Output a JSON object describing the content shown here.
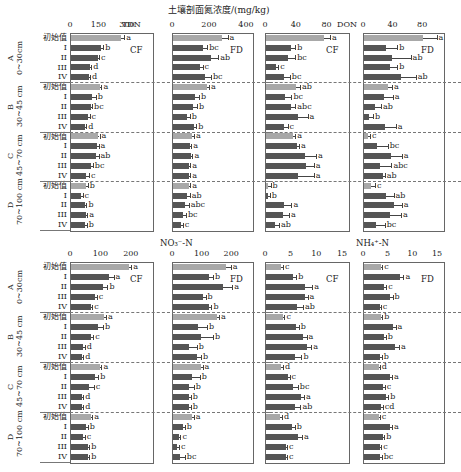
{
  "figure": {
    "top_title": "土壤剖面氮浓度/(mg/kg)",
    "bottom_left_title": "NO₃⁻-N",
    "bottom_right_title": "NH₄⁺-N",
    "row_labels": [
      "初始值",
      "I",
      "II",
      "III",
      "IV"
    ],
    "groups": [
      {
        "letter": "A",
        "depth": "0~30cm"
      },
      {
        "letter": "B",
        "depth": "30~45 cm"
      },
      {
        "letter": "C",
        "depth": "45~70 cm"
      },
      {
        "letter": "D",
        "depth": "70~100 cm"
      }
    ],
    "colors": {
      "initial_bar": "#a8a8a8",
      "treatment_bar": "#555555"
    }
  },
  "chart_data": [
    {
      "type": "bar",
      "orientation": "horizontal",
      "title": "TDN",
      "site": "CF",
      "xlabel": "TDN",
      "xlim": [
        0,
        400
      ],
      "xticks": [
        0,
        150,
        300
      ],
      "categories": [
        "A-初始值",
        "A-I",
        "A-II",
        "A-III",
        "A-IV",
        "B-初始值",
        "B-I",
        "B-II",
        "B-III",
        "B-IV",
        "C-初始值",
        "C-I",
        "C-II",
        "C-III",
        "C-IV",
        "D-初始值",
        "D-I",
        "D-II",
        "D-III",
        "D-IV"
      ],
      "values": [
        265,
        160,
        140,
        100,
        95,
        150,
        110,
        105,
        90,
        75,
        140,
        135,
        130,
        105,
        80,
        80,
        55,
        75,
        80,
        75
      ],
      "errors": [
        15,
        10,
        8,
        6,
        5,
        10,
        20,
        6,
        8,
        5,
        10,
        10,
        15,
        10,
        15,
        8,
        6,
        6,
        6,
        8
      ],
      "letters": [
        "a",
        "b",
        "c",
        "d",
        "d",
        "a",
        "b",
        "bc",
        "c",
        "d",
        "a",
        "a",
        "ab",
        "bc",
        "c",
        "b",
        "c",
        "b",
        "a",
        "b"
      ]
    },
    {
      "type": "bar",
      "orientation": "horizontal",
      "title": "TDN",
      "site": "FD",
      "xlim": [
        0,
        400
      ],
      "xticks": [
        0,
        200,
        400
      ],
      "categories": [
        "A-初始值",
        "A-I",
        "A-II",
        "A-III",
        "A-IV",
        "B-初始值",
        "B-I",
        "B-II",
        "B-III",
        "B-IV",
        "C-初始值",
        "C-I",
        "C-II",
        "C-III",
        "C-IV",
        "D-初始值",
        "D-I",
        "D-II",
        "D-III",
        "D-IV"
      ],
      "values": [
        265,
        160,
        205,
        145,
        175,
        185,
        120,
        110,
        75,
        115,
        105,
        90,
        95,
        85,
        85,
        85,
        75,
        65,
        55,
        45
      ],
      "errors": [
        30,
        25,
        40,
        15,
        30,
        10,
        20,
        20,
        15,
        10,
        8,
        8,
        10,
        8,
        8,
        8,
        15,
        20,
        15,
        8
      ],
      "letters": [
        "a",
        "bc",
        "ab",
        "c",
        "bc",
        "a",
        "b",
        "b",
        "b",
        "b",
        "a",
        "a",
        "a",
        "a",
        "a",
        "a",
        "ab",
        "abc",
        "bc",
        "c"
      ]
    },
    {
      "type": "bar",
      "orientation": "horizontal",
      "title": "DON",
      "site": "CF",
      "xlabel": "DON",
      "xlim": [
        0,
        100
      ],
      "xticks": [
        0,
        40,
        80
      ],
      "categories": [
        "A-初始值",
        "A-I",
        "A-II",
        "A-III",
        "A-IV",
        "B-初始值",
        "B-I",
        "B-II",
        "B-III",
        "B-IV",
        "C-初始值",
        "C-I",
        "C-II",
        "C-III",
        "C-IV",
        "D-初始值",
        "D-I",
        "D-II",
        "D-III",
        "D-IV"
      ],
      "values": [
        75,
        33,
        28,
        13,
        23,
        39,
        25,
        33,
        42,
        23,
        35,
        40,
        50,
        52,
        42,
        3,
        2,
        23,
        22,
        12
      ],
      "errors": [
        8,
        5,
        10,
        3,
        8,
        5,
        8,
        5,
        12,
        5,
        3,
        3,
        15,
        10,
        20,
        3,
        3,
        10,
        8,
        5
      ],
      "letters": [
        "a",
        "b",
        "bc",
        "c",
        "bc",
        "ab",
        "bc",
        "abc",
        "a",
        "c",
        "a",
        "a",
        "a",
        "a",
        "a",
        "b",
        "b",
        "a",
        "a",
        "ab"
      ]
    },
    {
      "type": "bar",
      "orientation": "horizontal",
      "title": "DON",
      "site": "FD",
      "xlim": [
        0,
        100
      ],
      "xticks": [
        0,
        40,
        80
      ],
      "categories": [
        "A-初始值",
        "A-I",
        "A-II",
        "A-III",
        "A-IV",
        "B-初始值",
        "B-I",
        "B-II",
        "B-III",
        "B-IV",
        "C-初始值",
        "C-I",
        "C-II",
        "C-III",
        "C-IV",
        "D-初始值",
        "D-I",
        "D-II",
        "D-III",
        "D-IV"
      ],
      "values": [
        80,
        30,
        38,
        35,
        50,
        33,
        27,
        15,
        7,
        28,
        5,
        17,
        36,
        22,
        25,
        10,
        30,
        41,
        35,
        16
      ],
      "errors": [
        18,
        15,
        25,
        10,
        20,
        5,
        12,
        8,
        5,
        15,
        3,
        15,
        15,
        15,
        3,
        5,
        10,
        10,
        15,
        12
      ],
      "letters": [
        "a",
        "b",
        "ab",
        "b",
        "ab",
        "a",
        "a",
        "ab",
        "b",
        "a",
        "c",
        "bc",
        "a",
        "abc",
        "ab",
        "c",
        "ab",
        "a",
        "a",
        "bc"
      ]
    },
    {
      "type": "bar",
      "orientation": "horizontal",
      "title": "NO₃⁻-N",
      "site": "CF",
      "xlim": [
        0,
        250
      ],
      "xticks": [
        0,
        100,
        200
      ],
      "categories": [
        "A-初始值",
        "A-I",
        "A-II",
        "A-III",
        "A-IV",
        "B-初始值",
        "B-I",
        "B-II",
        "B-III",
        "B-IV",
        "C-初始值",
        "C-I",
        "C-II",
        "C-III",
        "C-IV",
        "D-初始值",
        "D-I",
        "D-II",
        "D-III",
        "D-IV"
      ],
      "values": [
        190,
        125,
        105,
        80,
        65,
        110,
        90,
        65,
        40,
        35,
        95,
        80,
        60,
        35,
        35,
        65,
        50,
        40,
        55,
        55
      ],
      "errors": [
        8,
        15,
        15,
        5,
        5,
        5,
        15,
        8,
        5,
        5,
        5,
        10,
        15,
        5,
        5,
        5,
        5,
        5,
        5,
        5
      ],
      "letters": [
        "a",
        "a",
        "b",
        "c",
        "c",
        "a",
        "b",
        "c",
        "d",
        "d",
        "a",
        "b",
        "c",
        "d",
        "d",
        "a",
        "b",
        "c",
        "b",
        "b"
      ]
    },
    {
      "type": "bar",
      "orientation": "horizontal",
      "title": "NO₃⁻-N",
      "site": "FD",
      "xlim": [
        0,
        250
      ],
      "xticks": [
        0,
        100,
        200
      ],
      "categories": [
        "A-初始值",
        "A-I",
        "A-II",
        "A-III",
        "A-IV",
        "B-初始值",
        "B-I",
        "B-II",
        "B-III",
        "B-IV",
        "C-初始值",
        "C-I",
        "C-II",
        "C-III",
        "C-IV",
        "D-初始值",
        "D-I",
        "D-II",
        "D-III",
        "D-IV"
      ],
      "values": [
        180,
        120,
        170,
        100,
        120,
        150,
        85,
        95,
        55,
        80,
        95,
        65,
        55,
        55,
        55,
        65,
        35,
        20,
        15,
        25
      ],
      "errors": [
        15,
        15,
        30,
        10,
        10,
        5,
        30,
        40,
        25,
        15,
        5,
        25,
        15,
        5,
        5,
        5,
        5,
        5,
        5,
        15
      ],
      "letters": [
        "a",
        "b",
        "a",
        "b",
        "b",
        "a",
        "b",
        "b",
        "b",
        "b",
        "a",
        "b",
        "b",
        "b",
        "b",
        "a",
        "b",
        "c",
        "c",
        "bc"
      ]
    },
    {
      "type": "bar",
      "orientation": "horizontal",
      "title": "NH₄⁺-N",
      "site": "CF",
      "xlim": [
        0,
        15
      ],
      "xticks": [
        0,
        5,
        10,
        15
      ],
      "categories": [
        "A-初始值",
        "A-I",
        "A-II",
        "A-III",
        "A-IV",
        "B-初始值",
        "B-I",
        "B-II",
        "B-III",
        "B-IV",
        "C-初始值",
        "C-I",
        "C-II",
        "C-III",
        "C-IV",
        "D-初始值",
        "D-I",
        "D-II",
        "D-III",
        "D-IV"
      ],
      "values": [
        3,
        5.3,
        7.5,
        7.5,
        6,
        3.3,
        5.8,
        7.3,
        8,
        5.7,
        3,
        4.2,
        5.2,
        6.8,
        5.7,
        2.8,
        5,
        6.2,
        3.8,
        3.8
      ],
      "errors": [
        0.3,
        0.6,
        1.5,
        0.6,
        1.2,
        0.3,
        0.6,
        0.6,
        0.8,
        1.2,
        0.3,
        0.4,
        1,
        0.6,
        1,
        0.3,
        0.6,
        0.8,
        0.3,
        0.3
      ],
      "letters": [
        "c",
        "b",
        "a",
        "a",
        "ab",
        "c",
        "b",
        "a",
        "a",
        "b",
        "d",
        "c",
        "bc",
        "a",
        "ab",
        "d",
        "b",
        "a",
        "c",
        "c"
      ]
    },
    {
      "type": "bar",
      "orientation": "horizontal",
      "title": "NH₄⁺-N",
      "site": "FD",
      "xlim": [
        0,
        15
      ],
      "xticks": [
        0,
        5,
        10,
        15
      ],
      "categories": [
        "A-初始值",
        "A-I",
        "A-II",
        "A-III",
        "A-IV",
        "B-初始值",
        "B-I",
        "B-II",
        "B-III",
        "B-IV",
        "C-初始值",
        "C-I",
        "C-II",
        "C-III",
        "C-IV",
        "D-初始值",
        "D-I",
        "D-II",
        "D-III",
        "D-IV"
      ],
      "values": [
        3.5,
        7.2,
        4,
        5.2,
        3.2,
        3.5,
        5.8,
        4,
        6.3,
        3.3,
        3,
        5.3,
        3.8,
        4.5,
        3.5,
        3,
        5.3,
        3.8,
        3.3,
        3.3
      ],
      "errors": [
        0.2,
        0.8,
        0.5,
        0.6,
        0.2,
        0.2,
        0.6,
        0.4,
        0.8,
        0.3,
        0.2,
        0.4,
        0.4,
        0.4,
        0.3,
        0.2,
        0.4,
        0.3,
        0.2,
        0.3
      ],
      "letters": [
        "c",
        "a",
        "c",
        "b",
        "c",
        "b",
        "a",
        "b",
        "a",
        "b",
        "d",
        "a",
        "c",
        "b",
        "cd",
        "c",
        "a",
        "b",
        "c",
        "bc"
      ]
    }
  ]
}
